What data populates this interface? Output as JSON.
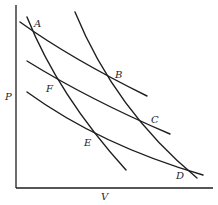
{
  "diagram": {
    "type": "P-V diagram (Carnot-like cycles)",
    "axes": {
      "y_label": "P",
      "x_label": "V"
    },
    "points": {
      "A": "A",
      "B": "B",
      "C": "C",
      "D": "D",
      "E": "E",
      "F": "F"
    },
    "curves": [
      {
        "name": "isotherm-top",
        "through": [
          "A",
          "B"
        ]
      },
      {
        "name": "isotherm-middle",
        "through": [
          "F",
          "C"
        ]
      },
      {
        "name": "isotherm-bottom",
        "through": [
          "E",
          "D"
        ]
      },
      {
        "name": "adiabat-left",
        "through": [
          "A",
          "F",
          "E"
        ]
      },
      {
        "name": "adiabat-right",
        "through": [
          "B",
          "C",
          "D"
        ]
      }
    ],
    "colors": {
      "stroke": "#1e1e1e",
      "background": "#ffffff"
    }
  }
}
